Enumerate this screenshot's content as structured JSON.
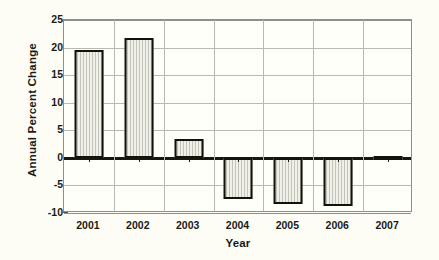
{
  "chart_data": {
    "type": "bar",
    "title": "",
    "xlabel": "Year",
    "ylabel": "Annual Percent Change",
    "categories": [
      "2001",
      "2002",
      "2003",
      "2004",
      "2005",
      "2006",
      "2007"
    ],
    "values": [
      19.5,
      21.8,
      3.5,
      -7.5,
      -8.4,
      -8.8,
      0.3
    ],
    "ylim": [
      -10,
      25
    ],
    "yticks": [
      25,
      20,
      15,
      10,
      5,
      0,
      -5,
      -10
    ],
    "ytick_labels": [
      "25",
      "20",
      "15",
      "10",
      "5",
      "0",
      "-5",
      "-10"
    ],
    "grid": true,
    "legend": "none",
    "bar_fill_color": "#dcdcd3",
    "bar_edge_color": "#12120c",
    "plot_background": "#fffffa",
    "figure_background": "#fdfdf5",
    "gridline_color": "#b9b9ad",
    "zero_line_color": "#17170f",
    "text_color": "#1a1a16"
  }
}
